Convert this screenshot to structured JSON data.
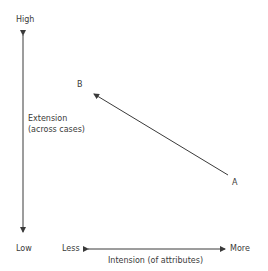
{
  "diagram": {
    "y_axis": {
      "top_label": "High",
      "bottom_label": "Low",
      "title_line1": "Extension",
      "title_line2": "(across cases)"
    },
    "x_axis": {
      "left_label": "Less",
      "right_label": "More",
      "title": "Intension (of attributes)"
    },
    "points": [
      {
        "label": "A",
        "x": 236,
        "y": 176
      },
      {
        "label": "B",
        "x": 78,
        "y": 84
      }
    ],
    "arrow": {
      "from": "A",
      "to": "B"
    },
    "colors": {
      "line": "#3a3a3a",
      "text": "#3a3a3a",
      "background": "#ffffff"
    }
  }
}
